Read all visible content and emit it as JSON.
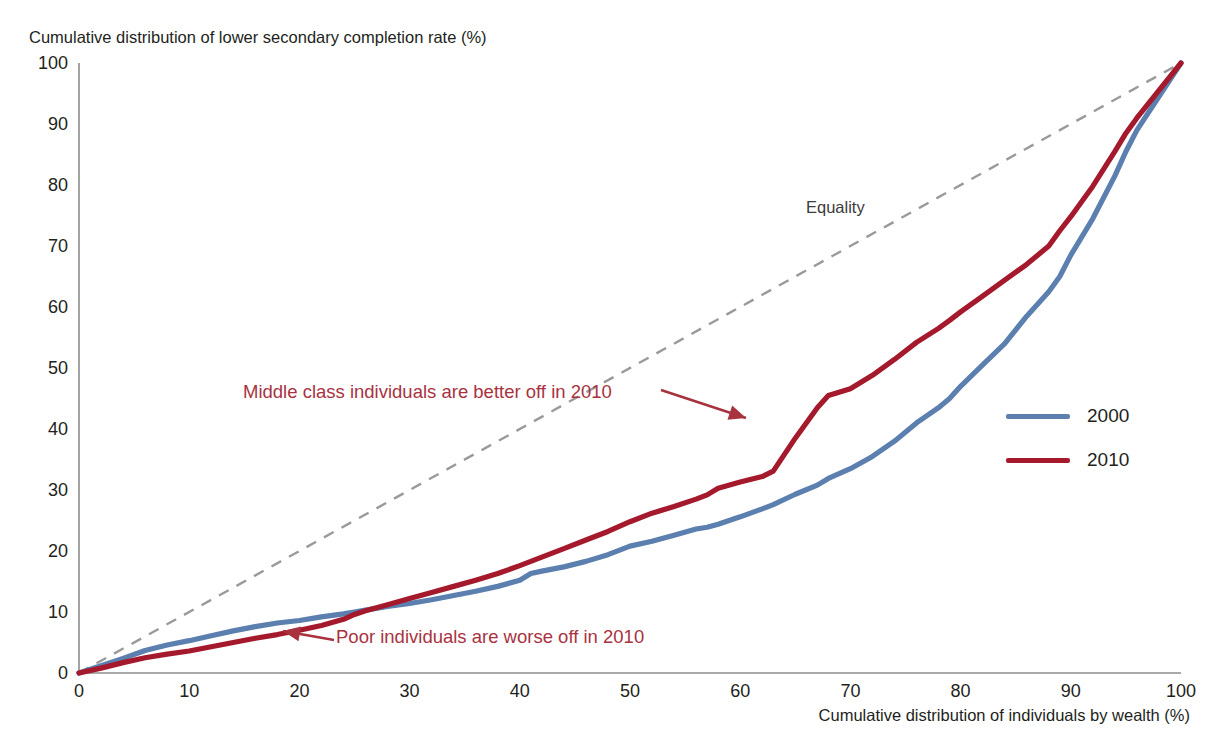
{
  "chart_data": {
    "type": "line",
    "title": "Cumulative distribution of lower secondary completion rate (%)",
    "ylabel": "Cumulative distribution of lower secondary completion rate (%)",
    "xlabel": "Cumulative distribution of individuals by wealth (%)",
    "xlim": [
      0,
      100
    ],
    "ylim": [
      0,
      100
    ],
    "grid": false,
    "legend_position": "right-middle",
    "xticks": [
      "0",
      "10",
      "20",
      "30",
      "40",
      "50",
      "60",
      "70",
      "80",
      "90",
      "100"
    ],
    "yticks": [
      "0",
      "10",
      "20",
      "30",
      "40",
      "50",
      "60",
      "70",
      "80",
      "90",
      "100"
    ],
    "x": [
      0,
      2,
      4,
      6,
      8,
      10,
      12,
      14,
      16,
      18,
      20,
      22,
      24,
      25,
      26,
      28,
      30,
      32,
      34,
      36,
      38,
      40,
      41,
      42,
      44,
      46,
      48,
      50,
      52,
      54,
      56,
      57,
      58,
      60,
      62,
      63,
      65,
      67,
      68,
      70,
      72,
      74,
      76,
      78,
      79,
      80,
      82,
      84,
      86,
      88,
      89,
      90,
      92,
      94,
      95,
      96,
      98,
      100
    ],
    "series": [
      {
        "name": "2000",
        "color": "#5b7fae",
        "values": [
          0,
          1.2,
          2.4,
          3.7,
          4.6,
          5.3,
          6.1,
          6.9,
          7.6,
          8.2,
          8.6,
          9.2,
          9.7,
          10.0,
          10.3,
          10.9,
          11.4,
          12.0,
          12.7,
          13.4,
          14.2,
          15.2,
          16.3,
          16.7,
          17.4,
          18.3,
          19.4,
          20.8,
          21.6,
          22.6,
          23.6,
          23.9,
          24.4,
          25.6,
          26.9,
          27.6,
          29.3,
          30.8,
          31.9,
          33.5,
          35.5,
          38.0,
          41.0,
          43.5,
          45.0,
          47.0,
          50.5,
          54.0,
          58.5,
          62.5,
          65.0,
          68.5,
          74.5,
          81.5,
          85.5,
          89.0,
          94.5,
          100
        ]
      },
      {
        "name": "2010",
        "color": "#a5192c",
        "values": [
          0,
          0.8,
          1.7,
          2.5,
          3.1,
          3.6,
          4.3,
          5.0,
          5.7,
          6.3,
          7.0,
          7.8,
          8.8,
          9.6,
          10.2,
          11.2,
          12.2,
          13.2,
          14.2,
          15.2,
          16.3,
          17.6,
          18.3,
          19.0,
          20.4,
          21.8,
          23.2,
          24.8,
          26.2,
          27.3,
          28.5,
          29.2,
          30.3,
          31.3,
          32.2,
          33.1,
          38.5,
          43.5,
          45.5,
          46.6,
          48.8,
          51.4,
          54.2,
          56.5,
          57.8,
          59.2,
          61.8,
          64.4,
          67.0,
          70.0,
          72.5,
          74.8,
          79.8,
          85.5,
          88.5,
          91.0,
          95.5,
          100
        ]
      }
    ],
    "reference_line": {
      "name": "Equality",
      "label": "Equality",
      "color": "#9a9a9a",
      "style": "dashed",
      "from": [
        0,
        0
      ],
      "to": [
        100,
        100
      ]
    },
    "annotations": [
      {
        "id": "middle-class",
        "text": "Middle class individuals are better off in 2010",
        "color": "#a8333f",
        "points_to": [
          60,
          42
        ]
      },
      {
        "id": "poor",
        "text": "Poor individuals are worse off in 2010",
        "color": "#a8333f",
        "points_to": [
          20,
          8
        ]
      }
    ],
    "legend": [
      {
        "label": "2000",
        "color": "#5b7fae"
      },
      {
        "label": "2010",
        "color": "#a5192c"
      }
    ]
  },
  "axis_color": "#8d8d8d"
}
